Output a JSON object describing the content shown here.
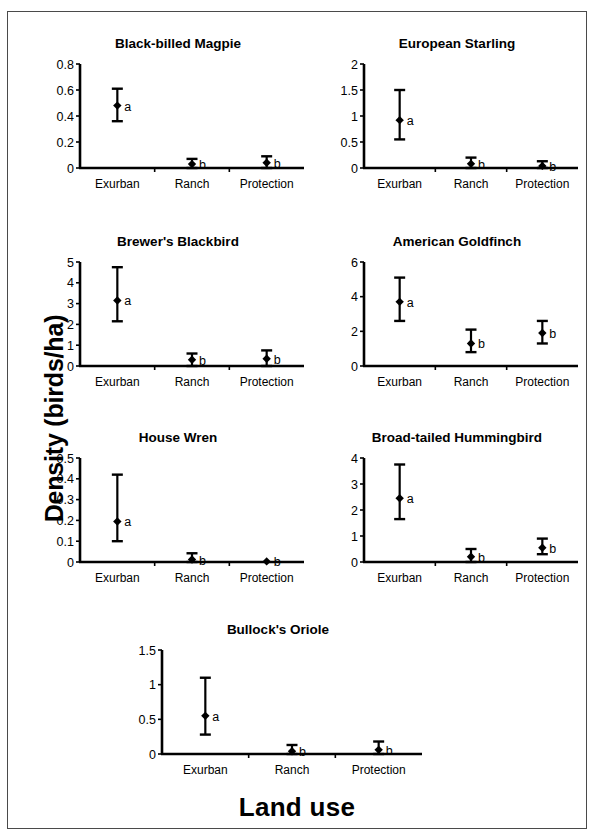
{
  "figure": {
    "y_axis_title": "Density (birds/ha)",
    "x_axis_title": "Land use",
    "categories": [
      "Exurban",
      "Ranch",
      "Protection"
    ],
    "axis_color": "#000000",
    "marker_color": "#000000"
  },
  "chart_data": [
    {
      "type": "scatter",
      "title": "Black-billed Magpie",
      "xlabel": "Land use",
      "ylabel": "Density (birds/ha)",
      "categories": [
        "Exurban",
        "Ranch",
        "Protection"
      ],
      "values": [
        0.48,
        0.03,
        0.04
      ],
      "err_low": [
        0.36,
        0.0,
        0.0
      ],
      "err_high": [
        0.61,
        0.07,
        0.09
      ],
      "group_letters": [
        "a",
        "b",
        "b"
      ],
      "ylim": [
        0,
        0.8
      ],
      "yticks": [
        0,
        0.2,
        0.4,
        0.6,
        0.8
      ],
      "ytick_labels": [
        "0",
        "0.2",
        "0.4",
        "0.6",
        "0.8"
      ],
      "grid": false,
      "legend": "none"
    },
    {
      "type": "scatter",
      "title": "European Starling",
      "xlabel": "Land use",
      "ylabel": "Density (birds/ha)",
      "categories": [
        "Exurban",
        "Ranch",
        "Protection"
      ],
      "values": [
        0.92,
        0.08,
        0.04
      ],
      "err_low": [
        0.55,
        0.0,
        0.0
      ],
      "err_high": [
        1.5,
        0.2,
        0.13
      ],
      "group_letters": [
        "a",
        "b",
        "b"
      ],
      "ylim": [
        0,
        2
      ],
      "yticks": [
        0,
        0.5,
        1,
        1.5,
        2
      ],
      "ytick_labels": [
        "0",
        "0.5",
        "1",
        "1.5",
        "2"
      ],
      "grid": false,
      "legend": "none"
    },
    {
      "type": "scatter",
      "title": "Brewer's Blackbird",
      "xlabel": "Land use",
      "ylabel": "Density (birds/ha)",
      "categories": [
        "Exurban",
        "Ranch",
        "Protection"
      ],
      "values": [
        3.15,
        0.3,
        0.35
      ],
      "err_low": [
        2.15,
        0.0,
        0.0
      ],
      "err_high": [
        4.75,
        0.6,
        0.75
      ],
      "group_letters": [
        "a",
        "b",
        "b"
      ],
      "ylim": [
        0,
        5
      ],
      "yticks": [
        0,
        1,
        2,
        3,
        4,
        5
      ],
      "ytick_labels": [
        "0",
        "1",
        "2",
        "3",
        "4",
        "5"
      ],
      "grid": false,
      "legend": "none"
    },
    {
      "type": "scatter",
      "title": "American Goldfinch",
      "xlabel": "Land use",
      "ylabel": "Density (birds/ha)",
      "categories": [
        "Exurban",
        "Ranch",
        "Protection"
      ],
      "values": [
        3.7,
        1.3,
        1.9
      ],
      "err_low": [
        2.6,
        0.8,
        1.3
      ],
      "err_high": [
        5.1,
        2.1,
        2.6
      ],
      "group_letters": [
        "a",
        "b",
        "b"
      ],
      "ylim": [
        0,
        6
      ],
      "yticks": [
        0,
        2,
        4,
        6
      ],
      "ytick_labels": [
        "0",
        "2",
        "4",
        "6"
      ],
      "grid": false,
      "legend": "none"
    },
    {
      "type": "scatter",
      "title": "House Wren",
      "xlabel": "Land use",
      "ylabel": "Density (birds/ha)",
      "categories": [
        "Exurban",
        "Ranch",
        "Protection"
      ],
      "values": [
        0.195,
        0.012,
        0.003
      ],
      "err_low": [
        0.1,
        0.0,
        0.003
      ],
      "err_high": [
        0.42,
        0.042,
        0.003
      ],
      "group_letters": [
        "a",
        "b",
        "b"
      ],
      "ylim": [
        0,
        0.5
      ],
      "yticks": [
        0,
        0.1,
        0.2,
        0.3,
        0.4,
        0.5
      ],
      "ytick_labels": [
        "0",
        "0.1",
        "0.2",
        "0.3",
        "0.4",
        "0.5"
      ],
      "grid": false,
      "legend": "none"
    },
    {
      "type": "scatter",
      "title": "Broad-tailed Hummingbird",
      "xlabel": "Land use",
      "ylabel": "Density (birds/ha)",
      "categories": [
        "Exurban",
        "Ranch",
        "Protection"
      ],
      "values": [
        2.45,
        0.2,
        0.55
      ],
      "err_low": [
        1.65,
        0.0,
        0.3
      ],
      "err_high": [
        3.75,
        0.5,
        0.9
      ],
      "group_letters": [
        "a",
        "b",
        "b"
      ],
      "ylim": [
        0,
        4
      ],
      "yticks": [
        0,
        1,
        2,
        3,
        4
      ],
      "ytick_labels": [
        "0",
        "1",
        "2",
        "3",
        "4"
      ],
      "grid": false,
      "legend": "none"
    },
    {
      "type": "scatter",
      "title": "Bullock's Oriole",
      "xlabel": "Land use",
      "ylabel": "Density (birds/ha)",
      "categories": [
        "Exurban",
        "Ranch",
        "Protection"
      ],
      "values": [
        0.55,
        0.04,
        0.06
      ],
      "err_low": [
        0.28,
        0.0,
        0.0
      ],
      "err_high": [
        1.1,
        0.13,
        0.18
      ],
      "group_letters": [
        "a",
        "b",
        "b"
      ],
      "ylim": [
        0,
        1.5
      ],
      "yticks": [
        0,
        0.5,
        1,
        1.5
      ],
      "ytick_labels": [
        "0",
        "0.5",
        "1",
        "1.5"
      ],
      "grid": false,
      "legend": "none"
    }
  ]
}
